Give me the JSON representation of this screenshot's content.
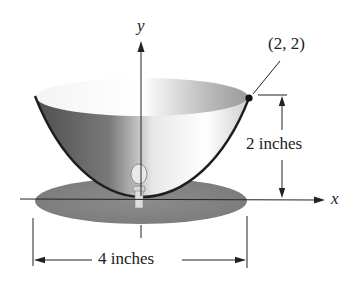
{
  "figure": {
    "axis_x_label": "x",
    "axis_y_label": "y",
    "point_label": "(2, 2)",
    "height_label": "2 inches",
    "width_label": "4 inches"
  },
  "colors": {
    "bowl_dark": "#5a5a5a",
    "bowl_light": "#f2f2f2",
    "saucer": "#8a8a8a",
    "line": "#222222"
  }
}
